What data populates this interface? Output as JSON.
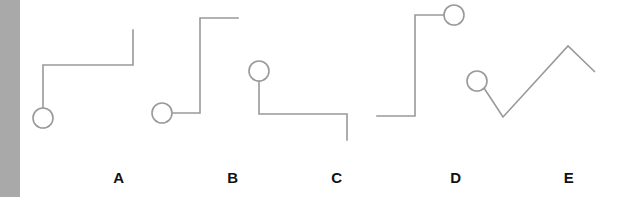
{
  "figure": {
    "background_color": "#ffffff",
    "left_strip_color": "#a9a9a9",
    "stroke_color": "#999999",
    "stroke_width": 1.6,
    "label_color": "#111111",
    "width": 627,
    "height": 197
  },
  "labels": [
    {
      "id": "A",
      "text": "A"
    },
    {
      "id": "B",
      "text": "B"
    },
    {
      "id": "C",
      "text": "C"
    },
    {
      "id": "D",
      "text": "D"
    },
    {
      "id": "E",
      "text": "E"
    }
  ],
  "chart_data": {
    "type": "line",
    "title": "",
    "xlabel": "",
    "ylabel": "",
    "grid": false,
    "legend": "none",
    "marker": {
      "shape": "open-circle",
      "radius": 10,
      "fill": "none"
    },
    "series": [
      {
        "name": "A",
        "label": "A",
        "marker_point": [
          43,
          118
        ],
        "points": [
          [
            43,
            108
          ],
          [
            43,
            65
          ],
          [
            133,
            65
          ],
          [
            133,
            30
          ]
        ],
        "segments": [
          "vertical-up",
          "horizontal-right",
          "vertical-up"
        ]
      },
      {
        "name": "B",
        "label": "B",
        "marker_point": [
          162,
          113
        ],
        "points": [
          [
            172,
            113
          ],
          [
            200,
            113
          ],
          [
            200,
            18
          ],
          [
            238,
            18
          ]
        ],
        "segments": [
          "horizontal-right",
          "vertical-up",
          "horizontal-right"
        ]
      },
      {
        "name": "C",
        "label": "C",
        "marker_point": [
          259,
          71
        ],
        "points": [
          [
            259,
            81
          ],
          [
            259,
            114
          ],
          [
            347,
            114
          ],
          [
            347,
            140
          ]
        ],
        "segments": [
          "vertical-down",
          "horizontal-right",
          "vertical-down"
        ]
      },
      {
        "name": "D",
        "label": "D",
        "marker_point": [
          454,
          15
        ],
        "points": [
          [
            444,
            15
          ],
          [
            415,
            15
          ],
          [
            415,
            116
          ],
          [
            377,
            116
          ]
        ],
        "segments": [
          "horizontal-left",
          "vertical-down",
          "horizontal-left"
        ]
      },
      {
        "name": "E",
        "label": "E",
        "marker_point": [
          477,
          81
        ],
        "points": [
          [
            484,
            88
          ],
          [
            503,
            117
          ],
          [
            568,
            46
          ],
          [
            595,
            72
          ]
        ],
        "segments": [
          "diagonal-down-right",
          "diagonal-up-right",
          "diagonal-down-right"
        ]
      }
    ]
  }
}
